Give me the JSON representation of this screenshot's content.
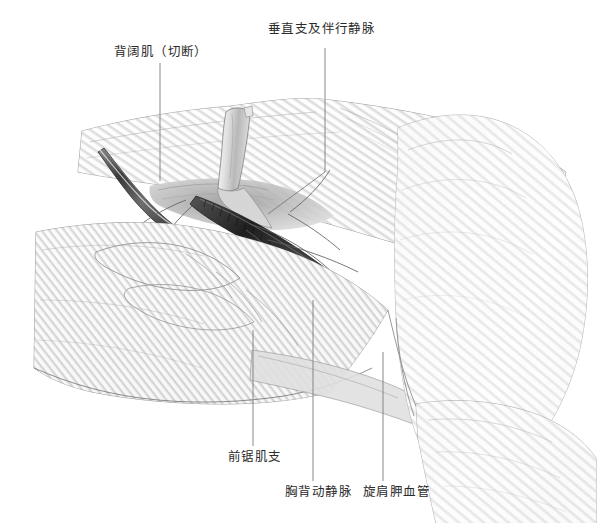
{
  "figure": {
    "type": "anatomical-illustration",
    "style": "grayscale-pencil-rendering",
    "width": 602,
    "height": 523,
    "background_color": "#ffffff",
    "ink_color": "#2b2b2b",
    "leader_line_color": "#7a7a7a"
  },
  "labels": {
    "latissimus_dorsi": "背阔肌（切断）",
    "vertical_branch": "垂直支及伴行静脉",
    "serratus_branch": "前锯肌支",
    "thoracodorsal_vessels": "胸背动静脉",
    "circumflex_scapular_vessels": "旋肩胛血管"
  },
  "leader_lines": [
    {
      "name": "latissimus-dorsi-leader",
      "x1": 160,
      "y1": 63,
      "x2": 160,
      "y2": 181
    },
    {
      "name": "vertical-branch-leader",
      "x1": 325,
      "y1": 48,
      "x2": 325,
      "y2": 172
    },
    {
      "name": "vertical-branch-leader-diagonal",
      "x1": 325,
      "y1": 172,
      "x2": 268,
      "y2": 214
    },
    {
      "name": "serratus-branch-leader",
      "x1": 253,
      "y1": 446,
      "x2": 253,
      "y2": 330
    },
    {
      "name": "thoracodorsal-leader",
      "x1": 313,
      "y1": 481,
      "x2": 313,
      "y2": 300
    },
    {
      "name": "circumflex-scapular-leader",
      "x1": 383,
      "y1": 481,
      "x2": 383,
      "y2": 352
    }
  ],
  "regions": [
    {
      "name": "latissimus-dorsi-muscle",
      "description": "上方大块斜纹肌腹，自左上延伸至右上肩部"
    },
    {
      "name": "latissimus-dorsi-cut-flap",
      "description": "左中部深色切断的肌瓣边缘，向下翻折"
    },
    {
      "name": "serratus-anterior-muscle",
      "description": "左下方指状突起的前锯肌肌齿"
    },
    {
      "name": "neurovascular-pedicle",
      "description": "中央深色胸背血管神经束，自腋窝向下外走行"
    },
    {
      "name": "deltoid-shoulder",
      "description": "右侧圆隆的三角肌与上臂轮廓"
    },
    {
      "name": "upper-arm",
      "description": "右下延伸的上臂外侧面"
    }
  ]
}
